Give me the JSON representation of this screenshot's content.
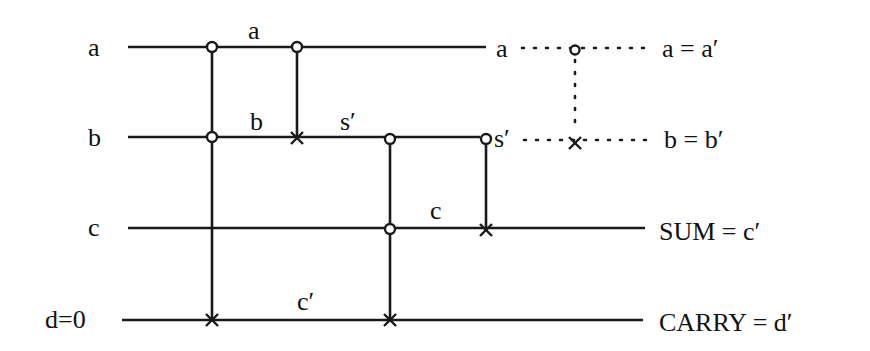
{
  "diagram": {
    "inputs": [
      {
        "id": "a",
        "label": "a"
      },
      {
        "id": "b",
        "label": "b"
      },
      {
        "id": "c",
        "label": "c"
      },
      {
        "id": "d",
        "label": "d=0"
      }
    ],
    "wire_labels": {
      "a_mid": "a",
      "b_mid": "b",
      "b_sprime": "s′",
      "c_mid": "c",
      "d_cprime": "c′",
      "a_end": "a",
      "b_end": "s′"
    },
    "outputs": [
      {
        "id": "a_out",
        "label": "a = a′"
      },
      {
        "id": "b_out",
        "label": "b = b′"
      },
      {
        "id": "sum",
        "label": "SUM = c′"
      },
      {
        "id": "carry",
        "label": "CARRY = d′"
      }
    ],
    "gates": [
      {
        "type": "toffoli",
        "controls": [
          "a",
          "b"
        ],
        "target": "d",
        "x": 212
      },
      {
        "type": "cnot",
        "controls": [
          "a"
        ],
        "target": "b",
        "x": 297
      },
      {
        "type": "toffoli",
        "controls": [
          "b",
          "c"
        ],
        "target": "d",
        "x": 390
      },
      {
        "type": "cnot",
        "controls": [
          "b"
        ],
        "target": "c",
        "x": 486
      },
      {
        "type": "cnot",
        "controls": [
          "a"
        ],
        "target": "b",
        "x": 575,
        "style": "dotted"
      }
    ],
    "colors": {
      "ink": "#1a1a1a",
      "background": "#ffffff"
    }
  }
}
